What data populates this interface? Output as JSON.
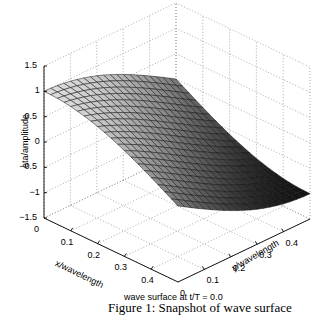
{
  "chart_data": {
    "type": "surface3d",
    "title": "wave surface at  t/T = 0.0",
    "xlabel": "x/wavelength",
    "ylabel": "y/wavelength",
    "zlabel": "eta/amplitude",
    "x_ticks": [
      "0",
      "0.1",
      "0.2",
      "0.3",
      "0.4"
    ],
    "y_ticks": [
      "0",
      "0.1",
      "0.2",
      "0.3",
      "0.4"
    ],
    "z_ticks": [
      "1.5",
      "1",
      "0.5",
      "0",
      "-0.5",
      "-1",
      "-1.5"
    ],
    "xlim": [
      0,
      0.5
    ],
    "ylim": [
      0,
      0.5
    ],
    "zlim": [
      -1.5,
      1.5
    ],
    "grid": true,
    "colormap": "gray",
    "mesh": {
      "nx": 21,
      "ny": 21
    },
    "function": "eta = cos(pi*(x + y))",
    "corner_values": {
      "x0_y0": 1.0,
      "x0.5_y0": 0.0,
      "x0_y0.5": 0.0,
      "x0.5_y0.5": -1.0
    }
  },
  "caption": "Figure 1: Snapshot of wave surface"
}
